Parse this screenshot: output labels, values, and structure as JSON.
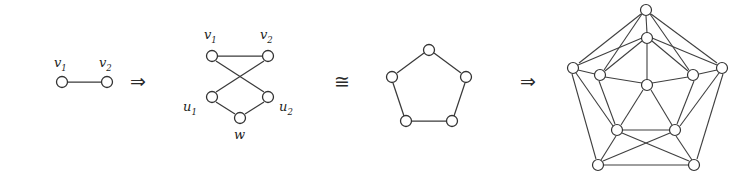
{
  "figure": {
    "type": "graph-transformation-sequence",
    "background": "#ffffff",
    "stroke_color": "#3a3a3a",
    "node_fill": "#ffffff",
    "node_stroke": "#333333"
  },
  "operators": {
    "implies": "⇒",
    "isomorphic": "≅",
    "implies_2": "⇒"
  },
  "labels": {
    "v1": "v",
    "v1_sub": "1",
    "v2": "v",
    "v2_sub": "2",
    "u1": "u",
    "u1_sub": "1",
    "u2": "u",
    "u2_sub": "2",
    "w": "w"
  },
  "graphs": [
    {
      "name": "single-edge-graph",
      "vertex_count": 2,
      "edge_count": 1,
      "vertices": [
        {
          "id": "v1",
          "label": "v1",
          "x": 62,
          "y": 82
        },
        {
          "id": "v2",
          "label": "v2",
          "x": 107,
          "y": 82
        }
      ],
      "edges": [
        [
          "v1",
          "v2"
        ]
      ]
    },
    {
      "name": "five-vertex-bowtie-graph",
      "vertex_count": 5,
      "edge_count": 5,
      "vertices": [
        {
          "id": "v1",
          "label": "v1",
          "x": 212,
          "y": 56
        },
        {
          "id": "v2",
          "label": "v2",
          "x": 268,
          "y": 56
        },
        {
          "id": "u1",
          "label": "u1",
          "x": 212,
          "y": 97
        },
        {
          "id": "u2",
          "label": "u2",
          "x": 268,
          "y": 97
        },
        {
          "id": "w",
          "label": "w",
          "x": 240,
          "y": 118
        }
      ],
      "edges": [
        [
          "v1",
          "v2"
        ],
        [
          "v1",
          "u2"
        ],
        [
          "v2",
          "u1"
        ],
        [
          "u1",
          "w"
        ],
        [
          "u2",
          "w"
        ]
      ]
    },
    {
      "name": "pentagon-cycle-graph",
      "vertex_count": 5,
      "edge_count": 5,
      "vertices": [
        {
          "id": "p0",
          "x": 429,
          "y": 50
        },
        {
          "id": "p1",
          "x": 466,
          "y": 77
        },
        {
          "id": "p2",
          "x": 452,
          "y": 121
        },
        {
          "id": "p3",
          "x": 406,
          "y": 121
        },
        {
          "id": "p4",
          "x": 392,
          "y": 77
        }
      ],
      "edges": [
        [
          "p0",
          "p1"
        ],
        [
          "p1",
          "p2"
        ],
        [
          "p2",
          "p3"
        ],
        [
          "p3",
          "p4"
        ],
        [
          "p4",
          "p0"
        ]
      ]
    },
    {
      "name": "thirteen-vertex-graph",
      "vertex_count": 11,
      "edge_count": 27,
      "vertices": [
        {
          "id": "o0",
          "x": 646,
          "y": 10
        },
        {
          "id": "o1",
          "x": 722,
          "y": 68
        },
        {
          "id": "o2",
          "x": 694,
          "y": 165
        },
        {
          "id": "o3",
          "x": 598,
          "y": 165
        },
        {
          "id": "o4",
          "x": 573,
          "y": 68
        },
        {
          "id": "i0",
          "x": 647,
          "y": 38
        },
        {
          "id": "i1",
          "x": 693,
          "y": 75
        },
        {
          "id": "i2",
          "x": 675,
          "y": 130
        },
        {
          "id": "i3",
          "x": 617,
          "y": 130
        },
        {
          "id": "i4",
          "x": 600,
          "y": 75
        },
        {
          "id": "c",
          "x": 647,
          "y": 85
        }
      ],
      "edges": [
        [
          "o0",
          "o4"
        ],
        [
          "o0",
          "o1"
        ],
        [
          "o4",
          "o3"
        ],
        [
          "o1",
          "o2"
        ],
        [
          "o3",
          "o2"
        ],
        [
          "i0",
          "i1"
        ],
        [
          "i1",
          "i2"
        ],
        [
          "i2",
          "i3"
        ],
        [
          "i3",
          "i4"
        ],
        [
          "i4",
          "i0"
        ],
        [
          "c",
          "i0"
        ],
        [
          "c",
          "i1"
        ],
        [
          "c",
          "i2"
        ],
        [
          "c",
          "i3"
        ],
        [
          "c",
          "i4"
        ],
        [
          "o0",
          "i0"
        ],
        [
          "o0",
          "i4"
        ],
        [
          "o0",
          "i1"
        ],
        [
          "o4",
          "i4"
        ],
        [
          "o4",
          "i0"
        ],
        [
          "o4",
          "i3"
        ],
        [
          "o1",
          "i1"
        ],
        [
          "o1",
          "i0"
        ],
        [
          "o1",
          "i2"
        ],
        [
          "o3",
          "i3"
        ],
        [
          "o3",
          "i2"
        ],
        [
          "o2",
          "i2"
        ],
        [
          "o2",
          "i3"
        ]
      ]
    }
  ]
}
